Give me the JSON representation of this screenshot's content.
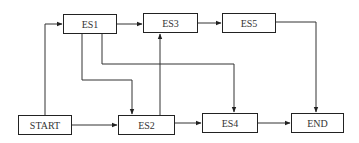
{
  "diagram": {
    "type": "network-flow",
    "nodes": [
      {
        "id": "ES1",
        "label": "ES1",
        "x": 63,
        "y": 14,
        "w": 54,
        "h": 20
      },
      {
        "id": "ES3",
        "label": "ES3",
        "x": 143,
        "y": 13,
        "w": 55,
        "h": 20
      },
      {
        "id": "ES5",
        "label": "ES5",
        "x": 222,
        "y": 13,
        "w": 54,
        "h": 20
      },
      {
        "id": "START",
        "label": "START",
        "x": 18,
        "y": 115,
        "w": 54,
        "h": 20
      },
      {
        "id": "ES2",
        "label": "ES2",
        "x": 118,
        "y": 115,
        "w": 57,
        "h": 20
      },
      {
        "id": "ES4",
        "label": "ES4",
        "x": 202,
        "y": 113,
        "w": 56,
        "h": 20
      },
      {
        "id": "END",
        "label": "END",
        "x": 291,
        "y": 113,
        "w": 53,
        "h": 20
      }
    ],
    "edges": [
      {
        "from": "START",
        "to": "ES1"
      },
      {
        "from": "START",
        "to": "ES2"
      },
      {
        "from": "ES1",
        "to": "ES3"
      },
      {
        "from": "ES1",
        "to": "ES2"
      },
      {
        "from": "ES1",
        "to": "ES4"
      },
      {
        "from": "ES2",
        "to": "ES3"
      },
      {
        "from": "ES2",
        "to": "ES4"
      },
      {
        "from": "ES3",
        "to": "ES5"
      },
      {
        "from": "ES4",
        "to": "END"
      },
      {
        "from": "ES5",
        "to": "END"
      }
    ]
  }
}
